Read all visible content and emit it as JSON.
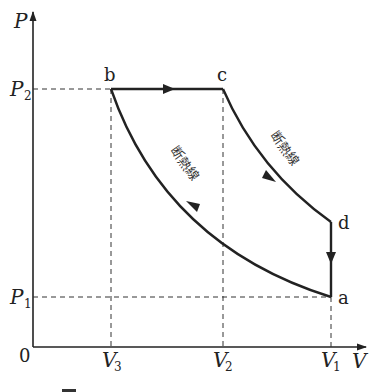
{
  "axes": {
    "y_label": "P",
    "x_label": "V",
    "origin_label": "0",
    "y_ticks": [
      {
        "main": "P",
        "sub": "2"
      },
      {
        "main": "P",
        "sub": "1"
      }
    ],
    "x_ticks": [
      {
        "main": "V",
        "sub": "3"
      },
      {
        "main": "V",
        "sub": "2"
      },
      {
        "main": "V",
        "sub": "1"
      }
    ]
  },
  "points": {
    "a": "a",
    "b": "b",
    "c": "c",
    "d": "d"
  },
  "curve_labels": {
    "adiabatic_upper": "断熱線",
    "adiabatic_lower": "断熱線"
  },
  "caption": "図"
}
